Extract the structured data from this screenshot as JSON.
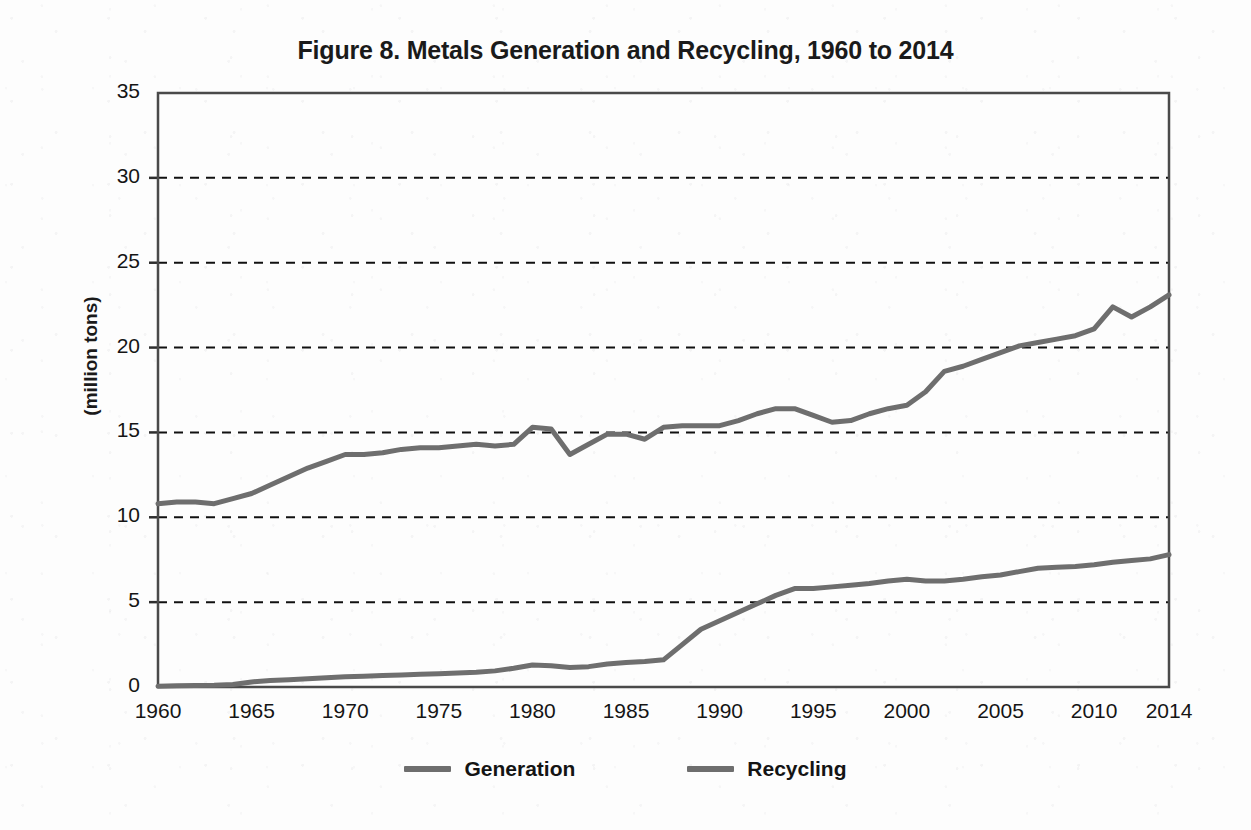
{
  "figure": {
    "title": "Figure 8. Metals Generation and Recycling, 1960 to 2014",
    "y_axis_title": "(million tons)"
  },
  "legend": {
    "items": [
      {
        "label": "Generation",
        "color": "#6e6e6e"
      },
      {
        "label": "Recycling",
        "color": "#6e6e6e"
      }
    ]
  },
  "axes": {
    "y_ticks": [
      "0",
      "5",
      "10",
      "15",
      "20",
      "25",
      "30",
      "35"
    ],
    "x_ticks": [
      "1960",
      "1965",
      "1970",
      "1975",
      "1980",
      "1985",
      "1990",
      "1995",
      "2000",
      "2005",
      "2010",
      "2014"
    ]
  },
  "chart_data": {
    "type": "line",
    "title": "Figure 8. Metals Generation and Recycling, 1960 to 2014",
    "xlabel": "",
    "ylabel": "(million tons)",
    "xlim": [
      1960,
      2014
    ],
    "ylim": [
      0,
      35
    ],
    "ytick_values": [
      0,
      5,
      10,
      15,
      20,
      25,
      30,
      35
    ],
    "xtick_values": [
      1960,
      1965,
      1970,
      1975,
      1980,
      1985,
      1990,
      1995,
      2000,
      2005,
      2010,
      2014
    ],
    "grid": "horizontal-dashed",
    "legend_position": "bottom",
    "line_color": "#6e6e6e",
    "x": [
      1960,
      1961,
      1962,
      1963,
      1964,
      1965,
      1966,
      1967,
      1968,
      1969,
      1970,
      1971,
      1972,
      1973,
      1974,
      1975,
      1976,
      1977,
      1978,
      1979,
      1980,
      1981,
      1982,
      1983,
      1984,
      1985,
      1986,
      1987,
      1988,
      1989,
      1990,
      1991,
      1992,
      1993,
      1994,
      1995,
      1996,
      1997,
      1998,
      1999,
      2000,
      2001,
      2002,
      2003,
      2004,
      2005,
      2006,
      2007,
      2008,
      2009,
      2010,
      2011,
      2012,
      2013,
      2014
    ],
    "series": [
      {
        "name": "Generation",
        "values": [
          10.8,
          10.9,
          10.9,
          10.8,
          11.1,
          11.4,
          11.9,
          12.4,
          12.9,
          13.3,
          13.7,
          13.7,
          13.8,
          14.0,
          14.1,
          14.1,
          14.2,
          14.3,
          14.2,
          14.3,
          15.3,
          15.2,
          13.7,
          14.3,
          14.9,
          14.9,
          14.6,
          15.3,
          15.4,
          15.4,
          15.4,
          15.7,
          16.1,
          16.4,
          16.4,
          16.0,
          15.6,
          15.7,
          16.1,
          16.4,
          16.6,
          17.4,
          18.6,
          18.9,
          19.3,
          19.7,
          20.1,
          20.3,
          20.5,
          20.7,
          21.1,
          22.4,
          21.8,
          22.4,
          23.1
        ]
      },
      {
        "name": "Recycling",
        "values": [
          0.05,
          0.07,
          0.09,
          0.1,
          0.15,
          0.3,
          0.38,
          0.43,
          0.49,
          0.55,
          0.6,
          0.64,
          0.68,
          0.71,
          0.75,
          0.78,
          0.82,
          0.87,
          0.95,
          1.1,
          1.3,
          1.25,
          1.15,
          1.2,
          1.35,
          1.45,
          1.5,
          1.6,
          2.5,
          3.4,
          3.9,
          4.4,
          4.9,
          5.4,
          5.8,
          5.8,
          5.9,
          6.0,
          6.1,
          6.25,
          6.35,
          6.25,
          6.25,
          6.35,
          6.5,
          6.6,
          6.8,
          7.0,
          7.05,
          7.1,
          7.2,
          7.35,
          7.45,
          7.55,
          7.8
        ]
      }
    ]
  }
}
